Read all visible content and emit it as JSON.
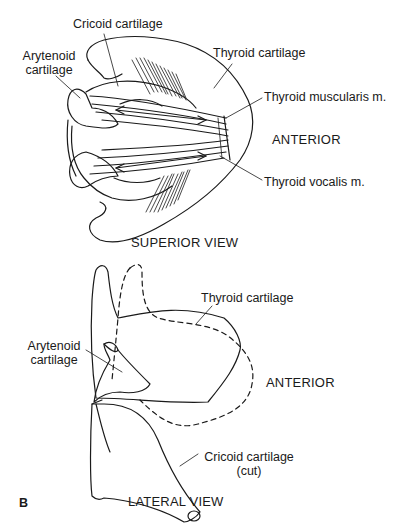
{
  "figure": {
    "panel_letter": "B",
    "superior_view": {
      "title": "SUPERIOR VIEW",
      "labels": {
        "cricoid": "Cricoid cartilage",
        "arytenoid_line1": "Arytenoid",
        "arytenoid_line2": "cartilage",
        "thyroid": "Thyroid cartilage",
        "muscularis": "Thyroid muscularis m.",
        "vocalis": "Thyroid vocalis m.",
        "anterior": "ANTERIOR"
      }
    },
    "lateral_view": {
      "title": "LATERAL VIEW",
      "labels": {
        "thyroid": "Thyroid cartilage",
        "arytenoid_line1": "Arytenoid",
        "arytenoid_line2": "cartilage",
        "anterior": "ANTERIOR",
        "cricoid_line1": "Cricoid cartilage",
        "cricoid_line2": "(cut)"
      }
    },
    "colors": {
      "ink": "#1a1a1a",
      "background": "#ffffff"
    }
  }
}
